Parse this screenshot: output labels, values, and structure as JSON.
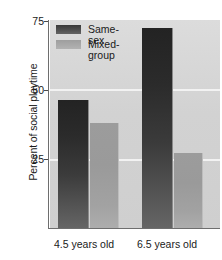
{
  "chart_data": {
    "type": "bar",
    "title": "",
    "subtitle": "",
    "xlabel": "",
    "ylabel": "Percent of social playtime",
    "categories": [
      "4.5 years old",
      "6.5 years old"
    ],
    "series": [
      {
        "name": "Same-sex",
        "values": [
          46,
          72
        ],
        "color": "#2b2b2b"
      },
      {
        "name": "Mixed-group",
        "values": [
          38,
          27
        ],
        "color": "#9e9e9e"
      }
    ],
    "ylim": [
      0,
      75
    ],
    "yticks": [
      25,
      50,
      75
    ],
    "ytick_labels": [
      "25",
      "50",
      "75"
    ],
    "grid": "horizontal-white",
    "gridline_values": [
      25,
      50
    ],
    "legend_position": "top-left-inside",
    "plot_background": "#d4d4d4"
  },
  "axis": {
    "y_label": "Percent of social playtime",
    "tick_75": "75",
    "tick_50": "50",
    "tick_25": "25"
  },
  "legend": {
    "entry_same_sex": "Same-sex",
    "entry_mixed_group": "Mixed-\ngroup"
  },
  "xaxis": {
    "category_1": "4.5 years old",
    "category_2": "6.5 years old"
  }
}
